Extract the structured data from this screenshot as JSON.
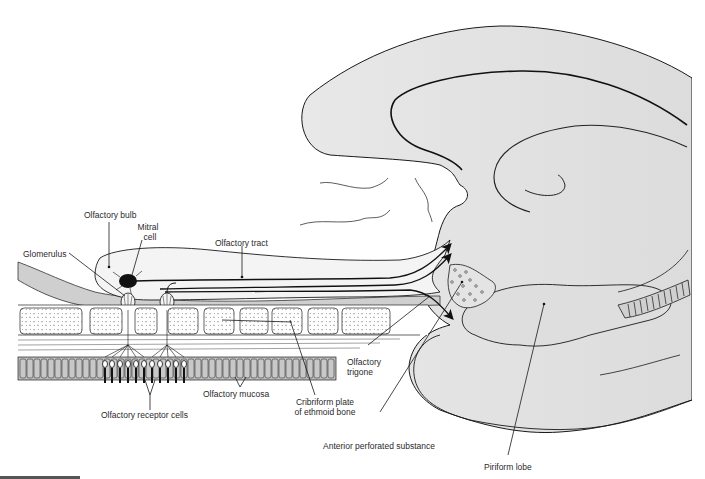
{
  "figure": {
    "colors": {
      "brain_fill": "#e2e2e2",
      "bone_fill": "#ffffff",
      "mucosa_fill": "#bdbdbd",
      "line": "#1a1a1a",
      "label_text": "#2a2a2a"
    }
  },
  "labels": {
    "olfactory_bulb": "Olfactory bulb",
    "mitral_cell_1": "Mitral",
    "mitral_cell_2": "cell",
    "glomerulus": "Glomerulus",
    "olfactory_tract": "Olfactory tract",
    "olfactory_trigone_1": "Olfactory",
    "olfactory_trigone_2": "trigone",
    "olfactory_mucosa": "Olfactory mucosa",
    "cribriform_1": "Cribriform plate",
    "cribriform_2": "of ethmoid bone",
    "receptor_cells": "Olfactory receptor cells",
    "anterior_perforated": "Anterior perforated substance",
    "piriform_lobe": "Piriform lobe"
  }
}
